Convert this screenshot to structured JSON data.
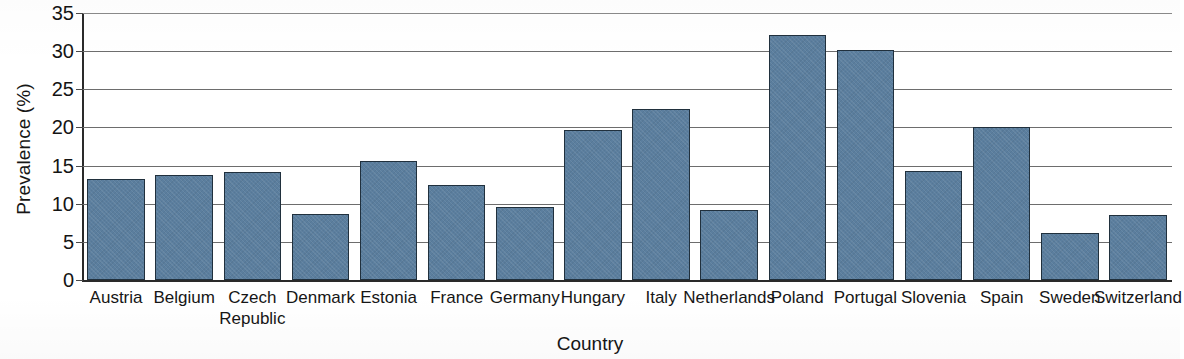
{
  "chart_data": {
    "type": "bar",
    "title": "",
    "xlabel": "Country",
    "ylabel": "Prevalence (%)",
    "ylim": [
      0,
      35
    ],
    "yticks": [
      0,
      5,
      10,
      15,
      20,
      25,
      30,
      35
    ],
    "ytick_labels": [
      "0",
      "5",
      "10",
      "15",
      "20",
      "25",
      "30",
      "35"
    ],
    "grid": "horizontal",
    "legend": "none",
    "bar_color": "#5b7e9e",
    "bar_edge_color": "#20303d",
    "categories": [
      "Austria",
      "Belgium",
      "Czech Republic",
      "Denmark",
      "Estonia",
      "France",
      "Germany",
      "Hungary",
      "Italy",
      "Netherlands",
      "Poland",
      "Portugal",
      "Slovenia",
      "Spain",
      "Sweden",
      "Switzerland"
    ],
    "values": [
      13.3,
      13.8,
      14.1,
      8.6,
      15.6,
      12.4,
      9.6,
      19.6,
      22.4,
      9.2,
      32.1,
      30.2,
      14.3,
      20.1,
      6.1,
      8.5
    ]
  }
}
